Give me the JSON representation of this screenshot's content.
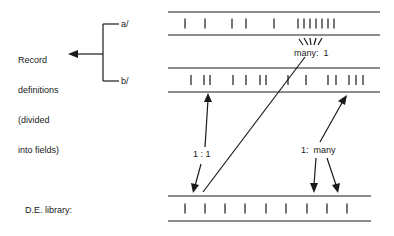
{
  "labels": {
    "record_definitions": [
      "Record",
      "definitions",
      "(divided",
      "into fields)"
    ],
    "branch_a": "a/",
    "branch_b": "b/",
    "many_to_one": "many:  1",
    "one_to_one": "1 : 1",
    "one_to_many": "1:  many",
    "de_library": "D.E. library:"
  },
  "records": {
    "a": {
      "y_top": 12,
      "y_bottom": 35,
      "x_start": 168,
      "x_end": 380,
      "ticks": [
        185,
        205,
        232,
        246,
        274,
        298,
        304,
        310,
        316,
        322,
        328,
        334
      ]
    },
    "b": {
      "y_top": 68,
      "y_bottom": 92,
      "x_start": 168,
      "x_end": 380,
      "ticks": [
        191,
        204,
        210,
        233,
        246,
        260,
        266,
        288,
        306,
        328,
        336,
        349,
        356,
        363
      ]
    },
    "library": {
      "y_top": 196,
      "y_bottom": 221,
      "x_start": 168,
      "x_end": 371,
      "ticks": [
        185,
        205,
        225,
        245,
        266,
        286,
        307,
        327,
        347
      ]
    }
  },
  "colors": {
    "ink": "#1a1a1a",
    "background": "#ffffff"
  }
}
